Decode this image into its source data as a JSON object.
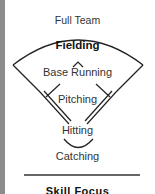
{
  "diagram": {
    "levels": [
      {
        "label": "Full Team"
      },
      {
        "label": "Fielding",
        "emphasis": "bold"
      },
      {
        "label": "Base Running"
      },
      {
        "label": "Pitching"
      },
      {
        "label": "Hitting"
      },
      {
        "label": "Catching"
      }
    ],
    "bottom_heading": "Skill Focus",
    "colors": {
      "line": "#222222",
      "side_strip": "#8c8c8c",
      "background": "#ffffff"
    }
  }
}
